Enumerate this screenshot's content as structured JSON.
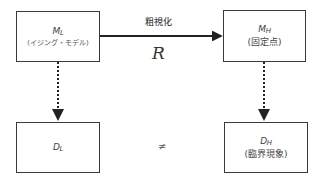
{
  "diagram": {
    "nodes": {
      "ml": {
        "symbol": "M",
        "subscript": "L",
        "caption": "(イジング・モデル)"
      },
      "mh": {
        "symbol": "M",
        "subscript": "H",
        "caption": "(固定点)"
      },
      "dl": {
        "symbol": "D",
        "subscript": "L",
        "caption": ""
      },
      "dh": {
        "symbol": "D",
        "subscript": "H",
        "caption": "(臨界現象)"
      }
    },
    "edges": {
      "coarse_graining": {
        "label": "粗視化",
        "operator": "R",
        "from": "ml",
        "to": "mh",
        "style": "solid"
      },
      "ml_to_dl": {
        "from": "ml",
        "to": "dl",
        "style": "dotted"
      },
      "mh_to_dh": {
        "from": "mh",
        "to": "dh",
        "style": "dotted"
      }
    },
    "relation": {
      "symbol": "≠",
      "between": [
        "dl",
        "dh"
      ]
    },
    "colors": {
      "line": "#222222",
      "box_border": "#3a3a3a",
      "background": "#ffffff"
    }
  }
}
